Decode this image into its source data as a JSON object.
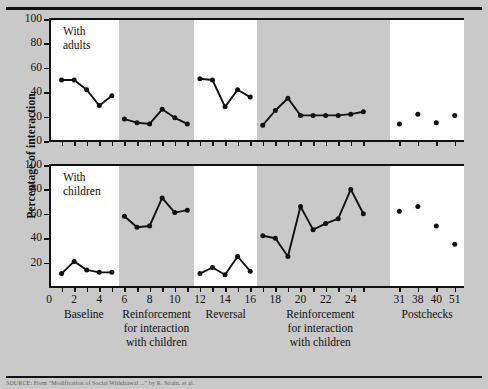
{
  "figure": {
    "ylabel": "Percentage of interaction",
    "citation_fragment": "SOURCE: From \"Modification of Social Withdrawal ...\" by R. Strain, et al."
  },
  "panels": [
    {
      "id": "adults",
      "caption": "With\nadults",
      "yticks": [
        0,
        20,
        40,
        60,
        80,
        100
      ]
    },
    {
      "id": "children",
      "caption": "With\nchildren",
      "yticks": [
        20,
        40,
        60,
        80,
        100
      ]
    }
  ],
  "xaxis": {
    "ticks": [
      1,
      2,
      3,
      4,
      5,
      6,
      7,
      8,
      9,
      10,
      11,
      12,
      13,
      14,
      15,
      16,
      17,
      18,
      19,
      20,
      21,
      22,
      23,
      24,
      25,
      31,
      38,
      40,
      51
    ],
    "labels": [
      {
        "value": 0,
        "text": "0"
      },
      {
        "value": 2,
        "text": "2"
      },
      {
        "value": 4,
        "text": "4"
      },
      {
        "value": 6,
        "text": "6"
      },
      {
        "value": 8,
        "text": "8"
      },
      {
        "value": 10,
        "text": "10"
      },
      {
        "value": 12,
        "text": "12"
      },
      {
        "value": 14,
        "text": "14"
      },
      {
        "value": 16,
        "text": "16"
      },
      {
        "value": 18,
        "text": "18"
      },
      {
        "value": 20,
        "text": "20"
      },
      {
        "value": 22,
        "text": "22"
      },
      {
        "value": 24,
        "text": "24"
      },
      {
        "value": 31,
        "text": "31"
      },
      {
        "value": 38,
        "text": "38"
      },
      {
        "value": 40,
        "text": "40"
      },
      {
        "value": 51,
        "text": "51"
      }
    ]
  },
  "phases": [
    {
      "name": "baseline",
      "label": "Baseline",
      "shade": "white"
    },
    {
      "name": "reinforcement-1",
      "label": "Reinforcement\nfor interaction\nwith children",
      "shade": "grey"
    },
    {
      "name": "reversal",
      "label": "Reversal",
      "shade": "white"
    },
    {
      "name": "reinforcement-2",
      "label": "Reinforcement\nfor interaction\nwith children",
      "shade": "grey"
    },
    {
      "name": "postchecks",
      "label": "Postchecks",
      "shade": "white"
    }
  ],
  "chart_data": {
    "type": "line",
    "title": "",
    "xlabel": "Sessions",
    "ylabel": "Percentage of interaction",
    "ylim": [
      0,
      100
    ],
    "ytick_step": 20,
    "grid": false,
    "legend": "none",
    "marker": "filled-circle",
    "line_color": "#111111",
    "panels": [
      {
        "name": "With adults",
        "segments": [
          {
            "phase": "Baseline",
            "x": [
              1,
              2,
              3,
              4,
              5
            ],
            "y": [
              50,
              50,
              42,
              29,
              37
            ]
          },
          {
            "phase": "Reinforcement for interaction with children",
            "x": [
              6,
              7,
              8,
              9,
              10,
              11
            ],
            "y": [
              18,
              15,
              14,
              26,
              19,
              14
            ]
          },
          {
            "phase": "Reversal",
            "x": [
              12,
              13,
              14,
              15,
              16
            ],
            "y": [
              51,
              50,
              28,
              42,
              36
            ]
          },
          {
            "phase": "Reinforcement for interaction with children",
            "x": [
              17,
              18,
              19,
              20,
              21,
              22,
              23,
              24,
              25
            ],
            "y": [
              13,
              25,
              35,
              21,
              21,
              21,
              21,
              22,
              24
            ]
          },
          {
            "phase": "Postchecks",
            "x": [
              31,
              38,
              40,
              51
            ],
            "y": [
              14,
              22,
              15,
              21
            ],
            "style": "points-only"
          }
        ]
      },
      {
        "name": "With children",
        "segments": [
          {
            "phase": "Baseline",
            "x": [
              1,
              2,
              3,
              4,
              5
            ],
            "y": [
              11,
              21,
              14,
              12,
              12
            ]
          },
          {
            "phase": "Reinforcement for interaction with children",
            "x": [
              6,
              7,
              8,
              9,
              10,
              11
            ],
            "y": [
              58,
              49,
              50,
              73,
              61,
              63
            ]
          },
          {
            "phase": "Reversal",
            "x": [
              12,
              13,
              14,
              15,
              16
            ],
            "y": [
              11,
              16,
              10,
              25,
              13
            ]
          },
          {
            "phase": "Reinforcement for interaction with children",
            "x": [
              17,
              18,
              19,
              20,
              21,
              22,
              23,
              24,
              25
            ],
            "y": [
              42,
              40,
              25,
              66,
              47,
              52,
              56,
              80,
              60
            ]
          },
          {
            "phase": "Postchecks",
            "x": [
              31,
              38,
              40,
              51
            ],
            "y": [
              62,
              66,
              50,
              35
            ],
            "style": "points-only"
          }
        ]
      }
    ]
  }
}
